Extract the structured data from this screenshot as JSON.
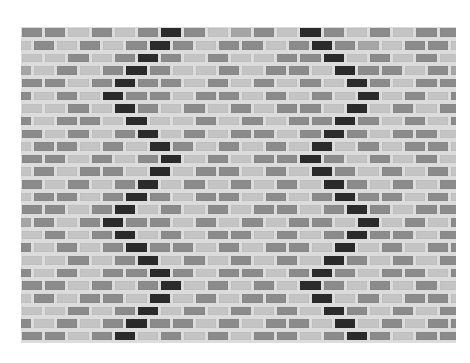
{
  "image": {
    "subject": "brick-pattern glass mosaic tile sheet with two zigzag lines of black tiles",
    "background": "#ffffff"
  },
  "palette": {
    "grout": "#dcdcdc",
    "D": "#8b8b8b",
    "M": "#a5a5a5",
    "L": "#c4c4c4",
    "K": "#2b2b2b"
  },
  "grid": {
    "rows": 25,
    "row_pitch": 12.65,
    "brick_pitch": 23.2,
    "odd_row_offset": 1,
    "even_row_offset": -10.6,
    "left_zigzag_index": [
      6,
      6,
      5,
      5,
      4,
      4,
      4,
      5,
      5,
      6,
      6,
      6,
      5,
      5,
      4,
      4,
      4,
      5,
      5,
      6,
      6,
      6,
      5,
      5,
      4
    ],
    "right_zigzag_index": [
      12,
      13,
      13,
      14,
      14,
      15,
      14,
      14,
      13,
      13,
      12,
      13,
      13,
      14,
      14,
      15,
      14,
      14,
      13,
      13,
      12,
      13,
      13,
      14,
      14
    ],
    "row_shades": [
      "DDLDLDDDLMDLDDLDLDD",
      "LDLDLDDDLDDLDLDMLDDL",
      "LLDLDDDLDLLDDDLDLDLD",
      "MLDLDDDLLDLDDLLDDLDM",
      "DDLDLDDLDLDLDLDDLDDL",
      "DLDLDDDLDDLDLDLDLDLD",
      "LLDLDDLDLDLDDLDLDLDL",
      "DLDDLDLLDLDLDDLDLDLD",
      "DLDLDDLDLDDLDLDLDDLD",
      "LDDLDLDDLDLDLDLDLDDL",
      "DDLDLDDLDLDDLDLDLDLD",
      "LDLDDLDLDDLDLDDLDLDL",
      "DLDLDDLDLDLDLDDLDLDD",
      "LDDLDLDLDDLDLDLDDLDL",
      "DDLDDLDLDLDDLDLDLDDL",
      "MDLDLDDLDLDLDDLDLDLD",
      "LDLDDLDLDDLDLDLDDLDL",
      "DLDLDLDDLDLDDLDLDLDD",
      "LLDLDDLDLDLDLDDLDLDL",
      "DLDLDDLDLDDLDLDLDDLD",
      "DDLDLDDLDLDLDDLDLDLD",
      "LDLDDLDLDLDDLDLDLDDL",
      "LLDLDDLDLDLDLDDLDLDL",
      "DLDLDLDDLDLDDLDLDLDD",
      "DDLDDLDLDLDDLDLDLDDL"
    ]
  }
}
